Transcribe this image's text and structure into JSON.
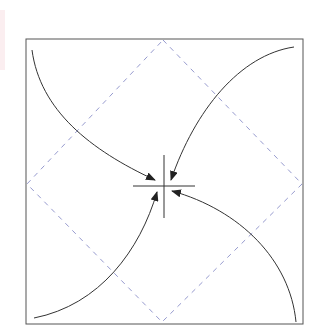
{
  "diagram": {
    "type": "pinwheel-convergence",
    "colors": {
      "background": "#ffffff",
      "frame": "#555555",
      "diamond": "#8a8fc8",
      "crosshair": "#333333",
      "arrows": "#333333",
      "edge_strip": "#fbeef0"
    },
    "frame": {
      "x": 26,
      "y": 39,
      "width": 277,
      "height": 285
    },
    "diamond": {
      "top": [
        163,
        40
      ],
      "right": [
        302,
        184
      ],
      "bottom": [
        162,
        322
      ],
      "left": [
        27,
        184
      ]
    },
    "crosshair": {
      "center": [
        164,
        186
      ],
      "horizontal": [
        133,
        195
      ],
      "vertical": [
        155,
        218
      ]
    },
    "arrows": [
      {
        "name": "top-left",
        "path": "M32,50 C40,110 90,150 155,180"
      },
      {
        "name": "top-right",
        "path": "M294,47 C240,55 195,110 171,180"
      },
      {
        "name": "bottom-left",
        "path": "M34,318 C100,305 140,250 157,192"
      },
      {
        "name": "bottom-right",
        "path": "M296,322 C290,260 240,210 172,191"
      }
    ]
  }
}
